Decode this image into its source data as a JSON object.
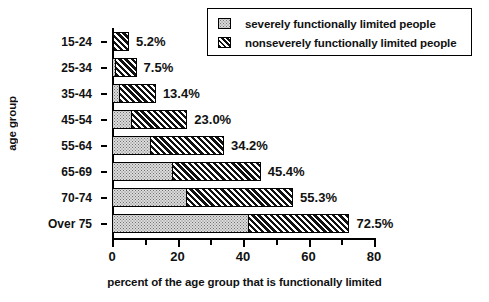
{
  "chart_data": {
    "type": "bar",
    "orientation": "horizontal",
    "stacked": true,
    "title": "",
    "xlabel": "percent of the age group that is functionally limited",
    "ylabel": "age group",
    "xlim": [
      0,
      80
    ],
    "xticks": [
      0,
      20,
      40,
      60,
      80
    ],
    "xtick_labels": [
      "0",
      "20",
      "40",
      "60",
      "80"
    ],
    "xminor_ticks": [
      10,
      30,
      50,
      70
    ],
    "grid": false,
    "legend_position": "top-right",
    "categories": [
      "15-24",
      "25-34",
      "35-44",
      "45-54",
      "55-64",
      "65-69",
      "70-74",
      "Over 75"
    ],
    "series": [
      {
        "name": "severely functionally limited people",
        "values": [
          0.3,
          0.8,
          2.0,
          5.8,
          11.6,
          18.3,
          22.6,
          41.5
        ]
      },
      {
        "name": "nonseverely functionally limited people",
        "values": [
          4.9,
          6.7,
          11.4,
          17.2,
          22.6,
          27.1,
          32.7,
          31.0
        ]
      }
    ],
    "totals": [
      5.2,
      7.5,
      13.4,
      23.0,
      34.2,
      45.4,
      55.3,
      72.5
    ],
    "data_labels": [
      "5.2%",
      "7.5%",
      "13.4%",
      "23.0%",
      "34.2%",
      "45.4%",
      "55.3%",
      "72.5%"
    ],
    "colors": {
      "severe": "#dcdcdc",
      "nonsevere": "#111111",
      "axis": "#000000",
      "background": "#ffffff"
    }
  },
  "legend": {
    "items": [
      {
        "label": "severely functionally limited people",
        "swatch": "dotted-light-gray"
      },
      {
        "label": "nonseverely functionally limited people",
        "swatch": "diagonal-hatch-black"
      }
    ]
  }
}
